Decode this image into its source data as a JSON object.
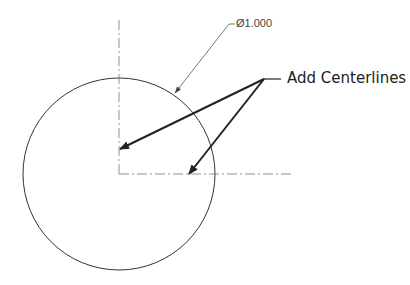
{
  "drawing": {
    "circle": {
      "cx": 119,
      "cy": 174,
      "r": 96,
      "stroke": "#333333"
    },
    "centerlines": {
      "vertical": {
        "x": 119,
        "y1": 20,
        "y2": 174
      },
      "horizontal": {
        "y": 174,
        "x1": 119,
        "x2": 292
      },
      "stroke": "#777777",
      "dash": "10 3 2 3"
    },
    "dimension": {
      "symbol": "Ø",
      "value": "1.000",
      "label": "Ø1.000",
      "leader": {
        "shelf_x1": 229,
        "shelf_x2": 235,
        "shelf_y": 24,
        "arrow_x": 175,
        "arrow_y": 93
      }
    },
    "callout": {
      "text": "Add Centerlines",
      "origin": {
        "x": 264,
        "y": 79
      },
      "shelf_end_x": 281,
      "arrows": [
        {
          "to_x": 120,
          "to_y": 149
        },
        {
          "to_x": 189,
          "to_y": 174
        }
      ],
      "stroke": "#222222"
    }
  }
}
